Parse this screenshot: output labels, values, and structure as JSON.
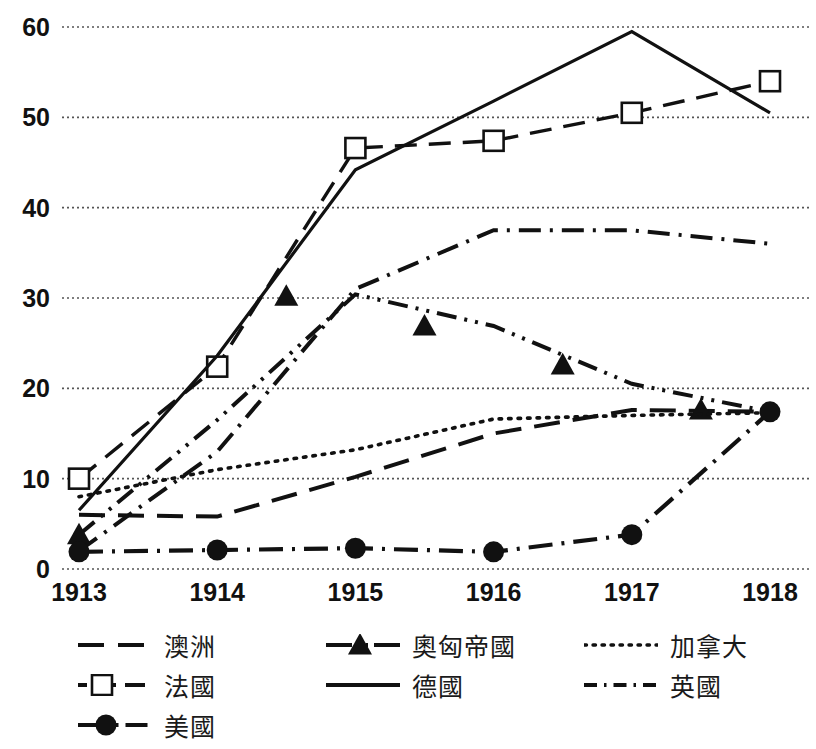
{
  "chart_data": {
    "type": "line",
    "title": "",
    "xlabel": "",
    "ylabel": "",
    "x": [
      1913,
      1914,
      1915,
      1916,
      1917,
      1918
    ],
    "xticklabels": [
      "1913",
      "1914",
      "1915",
      "1916",
      "1917",
      "1918"
    ],
    "yticklabels": [
      "0",
      "10",
      "20",
      "30",
      "40",
      "50",
      "60"
    ],
    "yticks": [
      0,
      10,
      20,
      30,
      40,
      50,
      60
    ],
    "ylim": [
      0,
      60
    ],
    "xlim": [
      1913,
      1918
    ],
    "grid": "horizontal-dotted",
    "legend_position": "below-chart",
    "series": [
      {
        "name": "澳洲",
        "key": "australia",
        "style": "dashed",
        "marker": "none",
        "color": "#111111",
        "values": [
          6.0,
          5.8,
          10.2,
          15.0,
          17.6,
          17.4
        ]
      },
      {
        "name": "奧匈帝國",
        "key": "austria-hungary",
        "style": "dash-dot-dot",
        "marker": "triangle",
        "color": "#111111",
        "values": [
          3.8,
          16.5,
          30.4,
          26.9,
          20.5,
          17.4
        ],
        "marker_x": [
          1913,
          1914.5,
          1915.5,
          1916.5,
          1917.5
        ],
        "marker_y": [
          3.8,
          30.2,
          26.9,
          22.6,
          17.6
        ]
      },
      {
        "name": "加拿大",
        "key": "canada",
        "style": "dotted",
        "marker": "none",
        "color": "#111111",
        "values": [
          8.0,
          11.0,
          13.2,
          16.6,
          17.0,
          17.3
        ]
      },
      {
        "name": "法國",
        "key": "france",
        "style": "dashed-square",
        "marker": "square-open",
        "color": "#111111",
        "values": [
          10.0,
          22.4,
          46.6,
          47.4,
          50.5,
          54.0
        ]
      },
      {
        "name": "德國",
        "key": "germany",
        "style": "solid",
        "marker": "none",
        "color": "#111111",
        "values": [
          6.5,
          23.6,
          44.2,
          51.8,
          59.5,
          50.5
        ]
      },
      {
        "name": "英國",
        "key": "britain",
        "style": "dash-dot",
        "marker": "none",
        "color": "#111111",
        "values": [
          2.0,
          13.0,
          31.0,
          37.5,
          37.5,
          36.0
        ]
      },
      {
        "name": "美國",
        "key": "usa",
        "style": "dash-dot-circle",
        "marker": "circle-filled",
        "color": "#111111",
        "values": [
          1.9,
          2.1,
          2.3,
          1.9,
          3.8,
          17.4
        ]
      }
    ]
  },
  "legend": {
    "items": [
      {
        "label": "澳洲",
        "key": "australia",
        "style": "dashed",
        "marker": "none"
      },
      {
        "label": "奧匈帝國",
        "key": "austria-hungary",
        "style": "dash-dot-dot",
        "marker": "triangle"
      },
      {
        "label": "加拿大",
        "key": "canada",
        "style": "dotted",
        "marker": "none"
      },
      {
        "label": "法國",
        "key": "france",
        "style": "dashed-square",
        "marker": "square-open"
      },
      {
        "label": "德國",
        "key": "germany",
        "style": "solid",
        "marker": "none"
      },
      {
        "label": "英國",
        "key": "britain",
        "style": "dash-dot",
        "marker": "none"
      },
      {
        "label": "美國",
        "key": "usa",
        "style": "dash-dot-circle",
        "marker": "circle-filled"
      }
    ]
  },
  "colors": {
    "ink": "#111111",
    "background": "#ffffff",
    "grid": "#555555"
  }
}
